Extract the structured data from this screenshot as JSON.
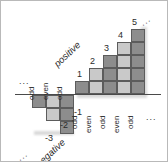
{
  "figure": {
    "axis_label_positive": "positive",
    "axis_label_negative": "negative",
    "ellipsis": "...",
    "colors": {
      "dark_cell": "#8d8d8d",
      "light_cell": "#c9c9c9",
      "cell_border": "#5c5c5c",
      "axis": "#4a4a4a",
      "background": "#ffffff",
      "text": "#2b2b2b"
    }
  },
  "columns_positive": [
    {
      "number": "1",
      "height": 1,
      "parity": "odd",
      "shade": "dark"
    },
    {
      "number": "2",
      "height": 2,
      "parity": "even",
      "shade": "light"
    },
    {
      "number": "3",
      "height": 3,
      "parity": "odd",
      "shade": "dark"
    },
    {
      "number": "4",
      "height": 4,
      "parity": "even",
      "shade": "light"
    },
    {
      "number": "5",
      "height": 5,
      "parity": "odd",
      "shade": "dark"
    }
  ],
  "columns_negative": [
    {
      "number": "-1",
      "height": 3,
      "parity": "odd",
      "shade": "dark"
    },
    {
      "number": "-2",
      "height": 2,
      "parity": "even",
      "shade": "light"
    },
    {
      "number": "-3",
      "height": 1,
      "parity": "odd",
      "shade": "dark"
    }
  ],
  "labels": {
    "n1": "1",
    "n2": "2",
    "n3": "3",
    "n4": "4",
    "n5": "5",
    "m1": "-1",
    "m2": "-2",
    "m3": "-3",
    "p_odd_1": "odd",
    "p_even_2": "even",
    "p_odd_3": "odd",
    "p_even_4": "even",
    "p_odd_5": "odd",
    "n_odd_1": "odd",
    "n_even_2": "even",
    "n_odd_3": "odd",
    "positive": "positive",
    "negative": "negative",
    "ellipsis_top_left": "...",
    "ellipsis_bottom_left": "...",
    "ellipsis_bottom_right": "...",
    "ellipsis_top_right": "..."
  }
}
